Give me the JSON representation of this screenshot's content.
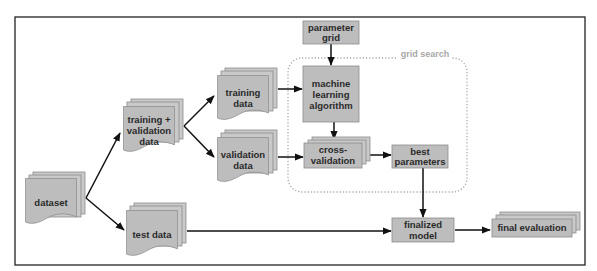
{
  "diagram": {
    "title": "",
    "group": {
      "label": "grid search",
      "style": "dotted-rounded",
      "color": "#a8a8a8"
    },
    "nodes": [
      {
        "id": "dataset",
        "label_lines": [
          "dataset"
        ],
        "shape": "document-stack"
      },
      {
        "id": "train_val",
        "label_lines": [
          "training +",
          "validation",
          "data"
        ],
        "shape": "document-stack"
      },
      {
        "id": "training",
        "label_lines": [
          "training",
          "data"
        ],
        "shape": "document-stack"
      },
      {
        "id": "validation",
        "label_lines": [
          "validation",
          "data"
        ],
        "shape": "document-stack"
      },
      {
        "id": "test",
        "label_lines": [
          "test data"
        ],
        "shape": "document-stack"
      },
      {
        "id": "param_grid",
        "label_lines": [
          "parameter",
          "grid"
        ],
        "shape": "rectangle"
      },
      {
        "id": "ml_algo",
        "label_lines": [
          "machine",
          "learning",
          "algorithm"
        ],
        "shape": "rectangle"
      },
      {
        "id": "cv",
        "label_lines": [
          "cross-",
          "validation"
        ],
        "shape": "rectangle-stack"
      },
      {
        "id": "best_params",
        "label_lines": [
          "best",
          "parameters"
        ],
        "shape": "rectangle"
      },
      {
        "id": "final_model",
        "label_lines": [
          "finalized",
          "model"
        ],
        "shape": "rectangle"
      },
      {
        "id": "final_eval",
        "label_lines": [
          "final evaluation"
        ],
        "shape": "rectangle-stack"
      }
    ],
    "edges": [
      {
        "from": "dataset",
        "to": "train_val"
      },
      {
        "from": "dataset",
        "to": "test"
      },
      {
        "from": "train_val",
        "to": "training"
      },
      {
        "from": "train_val",
        "to": "validation"
      },
      {
        "from": "training",
        "to": "ml_algo"
      },
      {
        "from": "param_grid",
        "to": "ml_algo"
      },
      {
        "from": "validation",
        "to": "cv"
      },
      {
        "from": "ml_algo",
        "to": "cv"
      },
      {
        "from": "cv",
        "to": "best_params"
      },
      {
        "from": "best_params",
        "to": "final_model"
      },
      {
        "from": "test",
        "to": "final_model"
      },
      {
        "from": "final_model",
        "to": "final_eval"
      }
    ],
    "colors": {
      "node_fill": "#bdbdbd",
      "node_stroke": "#8c8c8c",
      "edge": "#111111",
      "frame": "#222222"
    }
  },
  "labels": {
    "dataset": [
      "dataset"
    ],
    "train_val": [
      "training +",
      "validation",
      "data"
    ],
    "training": [
      "training",
      "data"
    ],
    "validation": [
      "validation",
      "data"
    ],
    "test": [
      "test data"
    ],
    "param_grid": [
      "parameter",
      "grid"
    ],
    "ml_algo": [
      "machine",
      "learning",
      "algorithm"
    ],
    "cv": [
      "cross-",
      "validation"
    ],
    "best_params": [
      "best",
      "parameters"
    ],
    "final_model": [
      "finalized",
      "model"
    ],
    "final_eval": [
      "final evaluation"
    ],
    "grid_search": "grid search"
  }
}
